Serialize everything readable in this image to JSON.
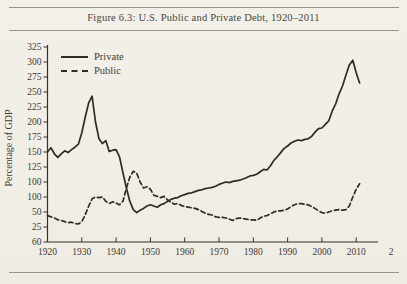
{
  "figure": {
    "title": "Figure 6.3: U.S. Public and Private Debt, 1920–2011"
  },
  "chart_data": {
    "type": "line",
    "title": "Figure 6.3: U.S. Public and Private Debt, 1920–2011",
    "xlabel": "",
    "ylabel": "Percentage of GDP",
    "grid": false,
    "legend_position": "top-left-inside",
    "xlim": [
      1920,
      2011
    ],
    "ylim": [
      0,
      325
    ],
    "x_tick_years": [
      1920,
      1930,
      1940,
      1950,
      1960,
      1970,
      1980,
      1990,
      2000,
      2010
    ],
    "x_tick_labels": [
      "1920",
      "1930",
      "1940",
      "1950",
      "1960",
      "1970",
      "1980",
      "1990",
      "2000",
      "2010"
    ],
    "x_edge_partial_label": "2",
    "y_tick_values": [
      325,
      300,
      275,
      250,
      225,
      200,
      175,
      150,
      125,
      100,
      75,
      50,
      25,
      0
    ],
    "y_tick_labels_printed": [
      "325",
      "300",
      "275",
      "250",
      "225",
      "200",
      "175",
      "150",
      "125",
      "100",
      "100",
      "50",
      "25",
      "60"
    ],
    "x_start_year": 1920,
    "series": [
      {
        "name": "Private",
        "style": "solid",
        "values": [
          150,
          157,
          147,
          141,
          147,
          152,
          149,
          154,
          158,
          163,
          182,
          208,
          232,
          243,
          200,
          172,
          164,
          169,
          151,
          153,
          154,
          142,
          115,
          90,
          68,
          54,
          49,
          53,
          56,
          60,
          62,
          60,
          58,
          62,
          64,
          68,
          71,
          73,
          74,
          77,
          79,
          81,
          82,
          84,
          86,
          87,
          89,
          90,
          91,
          93,
          96,
          98,
          100,
          99,
          101,
          102,
          103,
          105,
          107,
          110,
          111,
          113,
          117,
          121,
          120,
          127,
          136,
          142,
          149,
          156,
          160,
          165,
          168,
          170,
          169,
          171,
          172,
          176,
          183,
          189,
          190,
          196,
          202,
          218,
          230,
          247,
          260,
          278,
          295,
          303,
          282,
          265
        ]
      },
      {
        "name": "Public",
        "style": "dashed",
        "values": [
          44,
          42,
          40,
          37,
          36,
          34,
          32,
          33,
          31,
          30,
          34,
          45,
          60,
          72,
          75,
          74,
          75,
          68,
          64,
          67,
          65,
          62,
          68,
          90,
          108,
          118,
          115,
          100,
          90,
          92,
          88,
          78,
          76,
          74,
          76,
          70,
          66,
          63,
          64,
          61,
          59,
          58,
          57,
          56,
          54,
          51,
          48,
          46,
          45,
          42,
          41,
          41,
          40,
          38,
          36,
          39,
          40,
          39,
          38,
          37,
          37,
          36,
          40,
          43,
          44,
          47,
          50,
          52,
          52,
          53,
          55,
          59,
          62,
          64,
          64,
          63,
          62,
          59,
          56,
          52,
          49,
          48,
          50,
          52,
          53,
          54,
          53,
          54,
          60,
          75,
          88,
          97
        ]
      }
    ],
    "line_color": "#2f2c27"
  }
}
